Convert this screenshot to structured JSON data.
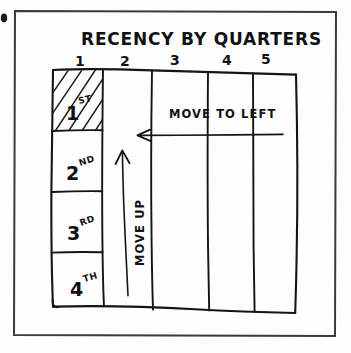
{
  "diagram": {
    "title": "RECENCY BY QUARTERS",
    "type": "hand-drawn-grid-matrix",
    "column_headers": [
      "1",
      "2",
      "3",
      "4",
      "5"
    ],
    "row_labels": [
      {
        "number": "1",
        "suffix": "ST"
      },
      {
        "number": "2",
        "suffix": "ND"
      },
      {
        "number": "3",
        "suffix": "RD"
      },
      {
        "number": "4",
        "suffix": "TH"
      }
    ],
    "annotations": [
      {
        "name": "move-to-left",
        "text": "MOVE TO LEFT",
        "direction": "left"
      },
      {
        "name": "move-up",
        "text": "MOVE UP",
        "direction": "up"
      }
    ],
    "highlighted_cell": {
      "row": "1",
      "column": "1",
      "fill": "diagonal-hatch"
    },
    "colors": {
      "ink": "#141414",
      "frame": "#3a3a3a",
      "background": "#fdfdfd"
    }
  }
}
